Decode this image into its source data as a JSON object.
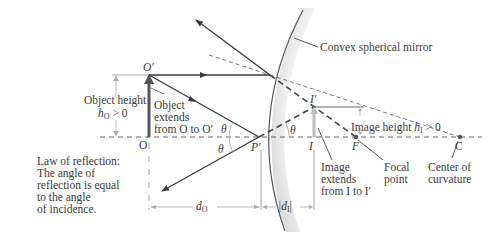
{
  "diagram": {
    "mirror_label": "Convex spherical mirror",
    "object_label": "O",
    "object_top_label": "O′",
    "object_height_label": "Object height",
    "object_height_expr": "h",
    "object_height_sub": "O",
    "object_height_cond": " > 0",
    "object_extends": [
      "Object",
      "extends",
      "from O to O′"
    ],
    "theta": "θ",
    "reflection_point_label": "P′",
    "image_label": "I",
    "image_top_label": "I′",
    "image_height_label": "Image height ",
    "image_height_expr": "h",
    "image_height_sub": "I",
    "image_height_cond": " > 0",
    "image_extends": [
      "Image",
      "extends",
      "from I to I′"
    ],
    "focal_point_symbol": "F",
    "focal_point_label": [
      "Focal",
      "point"
    ],
    "center_symbol": "C",
    "center_label": [
      "Center of",
      "curvature"
    ],
    "law_of_reflection": [
      "Law of reflection:",
      "The angle of",
      "reflection is equal",
      "to the angle",
      "of incidence."
    ],
    "object_distance": "d",
    "object_distance_sub": "O",
    "image_distance_open": "|d",
    "image_distance_sub": "I",
    "image_distance_close": "|",
    "colors": {
      "ray": "#3a3a3a",
      "object_arrow": "#555555",
      "image_arrow": "#b8b8b8",
      "mirror": "#555555",
      "dim_line": "#aaaaaa"
    }
  }
}
